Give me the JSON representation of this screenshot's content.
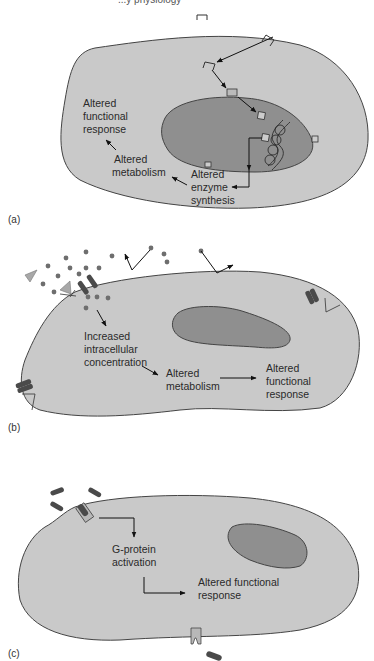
{
  "header": {
    "partial_text": "...y physiology"
  },
  "colors": {
    "cell_fill": "#c9c9c9",
    "nucleus_fill": "#8f8f8f",
    "outline": "#444444",
    "arrow": "#111111",
    "channel": "#4a4a4a",
    "ligand_dot": "#6e6e6e",
    "triangle": "#a8a8a8"
  },
  "panels": [
    {
      "id": "a",
      "label": "(a)",
      "texts": {
        "functional": [
          "Altered",
          "functional",
          "response"
        ],
        "metabolism": [
          "Altered",
          "metabolism"
        ],
        "enzyme": [
          "Altered",
          "enzyme",
          "synthesis"
        ]
      }
    },
    {
      "id": "b",
      "label": "(b)",
      "texts": {
        "concentration": [
          "Increased",
          "intracellular",
          "concentration"
        ],
        "metabolism": [
          "Altered",
          "metabolism"
        ],
        "functional": [
          "Altered",
          "functional",
          "response"
        ]
      }
    },
    {
      "id": "c",
      "label": "(c)",
      "texts": {
        "gprotein": [
          "G-protein",
          "activation"
        ],
        "functional": [
          "Altered functional",
          "response"
        ]
      }
    }
  ]
}
